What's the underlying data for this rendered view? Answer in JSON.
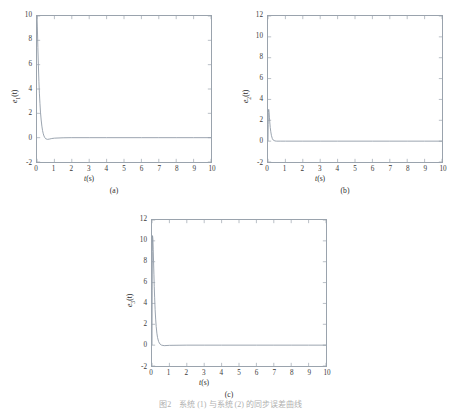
{
  "figure": {
    "caption": "图2　系统 (1) 与系统 (2) 的同步误差曲线"
  },
  "chart_data": [
    {
      "type": "line",
      "panel_label": "(a)",
      "title": "",
      "xlabel": "t(s)",
      "ylabel": "e1(t)",
      "ylabel_base": "e",
      "ylabel_sub": "1",
      "ylabel_tail": "(t)",
      "xlim": [
        0,
        10
      ],
      "ylim": [
        -2,
        10
      ],
      "xticks": [
        0,
        1,
        2,
        3,
        4,
        5,
        6,
        7,
        8,
        9,
        10
      ],
      "yticks": [
        -2,
        0,
        2,
        4,
        6,
        8,
        10
      ],
      "grid": false,
      "legend": "none",
      "series": [
        {
          "name": "e1",
          "color": "#8f9aa6",
          "x": [
            0,
            0.02,
            0.05,
            0.08,
            0.11,
            0.14,
            0.17,
            0.2,
            0.24,
            0.28,
            0.32,
            0.36,
            0.4,
            0.45,
            0.5,
            0.6,
            0.7,
            0.85,
            1.0,
            1.5,
            2.0,
            3.0,
            4.0,
            5.0,
            6.0,
            7.0,
            8.0,
            9.0,
            10.0
          ],
          "values": [
            10.0,
            9.1,
            7.4,
            5.9,
            4.6,
            3.6,
            2.8,
            2.1,
            1.45,
            0.95,
            0.58,
            0.32,
            0.14,
            0.0,
            -0.09,
            -0.14,
            -0.12,
            -0.07,
            -0.04,
            -0.01,
            0.0,
            0.0,
            0.0,
            0.0,
            0.0,
            0.0,
            0.0,
            0.0,
            0.0
          ]
        }
      ]
    },
    {
      "type": "line",
      "panel_label": "(b)",
      "title": "",
      "xlabel": "t(s)",
      "ylabel": "e2(t)",
      "ylabel_base": "e",
      "ylabel_sub": "2",
      "ylabel_tail": "(t)",
      "xlim": [
        0,
        10
      ],
      "ylim": [
        -2,
        12
      ],
      "xticks": [
        0,
        1,
        2,
        3,
        4,
        5,
        6,
        7,
        8,
        9,
        10
      ],
      "yticks": [
        -2,
        0,
        2,
        4,
        6,
        8,
        10,
        12
      ],
      "grid": false,
      "legend": "none",
      "series": [
        {
          "name": "e2",
          "color": "#8f9aa6",
          "x": [
            0,
            0.01,
            0.02,
            0.04,
            0.06,
            0.08,
            0.1,
            0.13,
            0.16,
            0.2,
            0.25,
            0.3,
            0.4,
            0.5,
            0.7,
            1.0,
            2.0,
            3.0,
            4.0,
            5.0,
            6.0,
            7.0,
            8.0,
            9.0,
            10.0
          ],
          "values": [
            0.0,
            1.6,
            2.75,
            3.05,
            2.8,
            2.3,
            1.85,
            1.3,
            0.9,
            0.52,
            0.24,
            0.1,
            0.02,
            0.0,
            0.0,
            0.0,
            0.0,
            0.0,
            0.0,
            0.0,
            0.0,
            0.0,
            0.0,
            0.0,
            0.0
          ]
        }
      ]
    },
    {
      "type": "line",
      "panel_label": "(c)",
      "title": "",
      "xlabel": "t(s)",
      "ylabel": "e3(t)",
      "ylabel_base": "e",
      "ylabel_sub": "3",
      "ylabel_tail": "(t)",
      "xlim": [
        0,
        10
      ],
      "ylim": [
        -2,
        12
      ],
      "xticks": [
        0,
        1,
        2,
        3,
        4,
        5,
        6,
        7,
        8,
        9,
        10
      ],
      "yticks": [
        -2,
        0,
        2,
        4,
        6,
        8,
        10,
        12
      ],
      "grid": false,
      "legend": "none",
      "series": [
        {
          "name": "e3",
          "color": "#8f9aa6",
          "x": [
            0,
            0.01,
            0.02,
            0.03,
            0.05,
            0.07,
            0.09,
            0.11,
            0.13,
            0.15,
            0.18,
            0.21,
            0.24,
            0.28,
            0.32,
            0.38,
            0.45,
            0.55,
            0.7,
            1.0,
            2.0,
            3.0,
            4.0,
            5.0,
            6.0,
            7.0,
            8.0,
            9.0,
            10.0
          ],
          "values": [
            0.0,
            5.2,
            9.0,
            10.5,
            10.2,
            9.2,
            8.0,
            6.8,
            5.6,
            4.6,
            3.4,
            2.5,
            1.8,
            1.15,
            0.72,
            0.34,
            0.12,
            0.0,
            -0.05,
            -0.02,
            0.0,
            0.0,
            0.0,
            0.0,
            0.0,
            0.0,
            0.0,
            0.0,
            0.0
          ]
        }
      ]
    }
  ]
}
